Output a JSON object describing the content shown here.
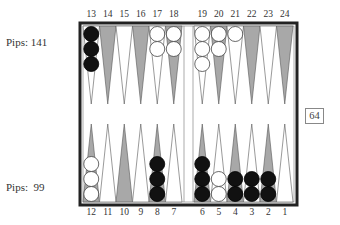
{
  "players": {
    "top": {
      "pips_label": "Pips: 141",
      "checker_color": "black"
    },
    "bottom": {
      "pips_label": "Pips:  99",
      "checker_color": "white"
    }
  },
  "cube": {
    "value": "64"
  },
  "point_labels": {
    "top": [
      "13",
      "14",
      "15",
      "16",
      "17",
      "18",
      "19",
      "20",
      "21",
      "22",
      "23",
      "24"
    ],
    "bottom": [
      "12",
      "11",
      "10",
      "9",
      "8",
      "7",
      "6",
      "5",
      "4",
      "3",
      "2",
      "1"
    ]
  },
  "colors": {
    "board_border": "#222222",
    "shaded_point": "#a8a8a8",
    "light_point": "#ffffff",
    "black_checker": "#111111",
    "white_checker": "#ffffff"
  },
  "position": {
    "top": [
      {
        "point": "13",
        "color": "black",
        "count": 3
      },
      {
        "point": "14",
        "color": "",
        "count": 0
      },
      {
        "point": "15",
        "color": "",
        "count": 0
      },
      {
        "point": "16",
        "color": "",
        "count": 0
      },
      {
        "point": "17",
        "color": "white",
        "count": 2
      },
      {
        "point": "18",
        "color": "white",
        "count": 2
      },
      {
        "point": "19",
        "color": "white",
        "count": 3
      },
      {
        "point": "20",
        "color": "white",
        "count": 2
      },
      {
        "point": "21",
        "color": "white",
        "count": 1
      },
      {
        "point": "22",
        "color": "",
        "count": 0
      },
      {
        "point": "23",
        "color": "",
        "count": 0
      },
      {
        "point": "24",
        "color": "",
        "count": 0
      }
    ],
    "bottom": [
      {
        "point": "12",
        "color": "white",
        "count": 3
      },
      {
        "point": "11",
        "color": "",
        "count": 0
      },
      {
        "point": "10",
        "color": "",
        "count": 0
      },
      {
        "point": "9",
        "color": "",
        "count": 0
      },
      {
        "point": "8",
        "color": "black",
        "count": 3
      },
      {
        "point": "7",
        "color": "",
        "count": 0
      },
      {
        "point": "6",
        "color": "black",
        "count": 3
      },
      {
        "point": "5",
        "color": "white",
        "count": 2
      },
      {
        "point": "4",
        "color": "black",
        "count": 2
      },
      {
        "point": "3",
        "color": "black",
        "count": 2
      },
      {
        "point": "2",
        "color": "black",
        "count": 2
      },
      {
        "point": "1",
        "color": "",
        "count": 0
      }
    ]
  }
}
